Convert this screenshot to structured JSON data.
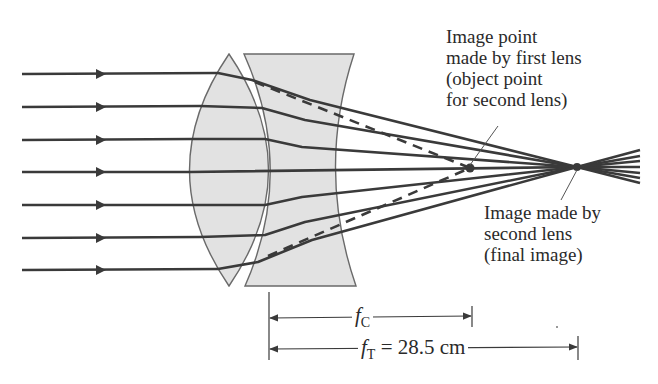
{
  "figure": {
    "type": "two-lens optical ray diagram (converging + diverging lens combination)",
    "ray_count": 7,
    "lens1": "converging (biconvex) lens",
    "lens2": "diverging (concave) lens",
    "colors": {
      "lens_fill": "#e2e2e2",
      "lens_stroke": "#6a6a6a",
      "ray": "#3a3a3a",
      "text": "#2a2a2a",
      "background": "#ffffff"
    }
  },
  "labels": {
    "first_image": {
      "lines": [
        "Image point",
        "made by first lens",
        "(object point",
        "for second lens)"
      ]
    },
    "final_image": {
      "lines": [
        "Image made by",
        "second lens",
        "(final image)"
      ]
    }
  },
  "dimensions": {
    "fc": {
      "symbol": "f",
      "subscript": "C",
      "value": ""
    },
    "ft": {
      "symbol": "f",
      "subscript": "T",
      "equals": " = 28.5 cm"
    }
  }
}
